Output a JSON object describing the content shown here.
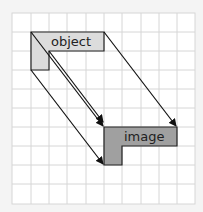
{
  "diagram": {
    "object_label": "object",
    "image_label": "image",
    "colors": {
      "object_fill": "#dcdcdc",
      "image_fill": "#a0a0a0",
      "grid": "#d6d6d6",
      "background": "#f4f4f4"
    }
  }
}
